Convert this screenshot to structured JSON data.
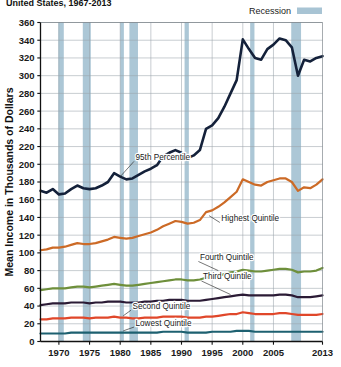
{
  "chart_data": {
    "type": "line",
    "title": "United States, 1967-2013",
    "title_visible_fragment": "United States, 1967-2013",
    "xlabel": "",
    "ylabel": "Mean Income in Thousands of Dollars",
    "xlim": [
      1967,
      2013
    ],
    "ylim": [
      0,
      360
    ],
    "ytick_step": 20,
    "yticks": [
      0,
      20,
      40,
      60,
      80,
      100,
      120,
      140,
      160,
      180,
      200,
      220,
      240,
      260,
      280,
      300,
      320,
      340,
      360
    ],
    "xticks": [
      1970,
      1975,
      1980,
      1985,
      1990,
      1995,
      2000,
      2005,
      2013
    ],
    "grid": "horizontal-and-vertical",
    "legend_position": "top-right",
    "legend": [
      {
        "label": "Recession",
        "color": "#a8c4d4",
        "type": "band"
      }
    ],
    "annotations": [
      {
        "text": "95th Percentile",
        "x": 1982.5,
        "y": 205,
        "leader_to_x": 1980.0,
        "leader_to_y": 186
      },
      {
        "text": "Highest  Quintile",
        "x": 1996.5,
        "y": 136,
        "leader_to_x": 1994.5,
        "leader_to_y": 142
      },
      {
        "text": "Fourth Quintile",
        "x": 1993.0,
        "y": 92,
        "leader_to_x": 1996.0,
        "leader_to_y": 80
      },
      {
        "text": "Third Quintile",
        "x": 1993.5,
        "y": 70,
        "leader_to_x": 1998.0,
        "leader_to_y": 53
      },
      {
        "text": "Second Quintile",
        "x": 1982.0,
        "y": 37,
        "leader_to_x": 1980.5,
        "leader_to_y": 29
      },
      {
        "text": "Lowest Quintile",
        "x": 1982.5,
        "y": 18,
        "leader_to_x": 1980.5,
        "leader_to_y": 12
      }
    ],
    "recessions": [
      {
        "start": 1969.9,
        "end": 1970.8
      },
      {
        "start": 1973.9,
        "end": 1975.2
      },
      {
        "start": 1980.0,
        "end": 1980.6
      },
      {
        "start": 1981.5,
        "end": 1982.9
      },
      {
        "start": 1990.5,
        "end": 1991.2
      },
      {
        "start": 2001.2,
        "end": 2001.9
      },
      {
        "start": 2007.9,
        "end": 2009.5
      }
    ],
    "x": [
      1967,
      1968,
      1969,
      1970,
      1971,
      1972,
      1973,
      1974,
      1975,
      1976,
      1977,
      1978,
      1979,
      1980,
      1981,
      1982,
      1983,
      1984,
      1985,
      1986,
      1987,
      1988,
      1989,
      1990,
      1991,
      1992,
      1993,
      1994,
      1995,
      1996,
      1997,
      1998,
      1999,
      2000,
      2001,
      2002,
      2003,
      2004,
      2005,
      2006,
      2007,
      2008,
      2009,
      2010,
      2011,
      2012,
      2013
    ],
    "series": [
      {
        "name": "95th Percentile",
        "color": "#14213a",
        "width": 2.6,
        "values": [
          170,
          168,
          172,
          166,
          167,
          172,
          176,
          173,
          172,
          173,
          176,
          180,
          190,
          186,
          183,
          184,
          188,
          192,
          195,
          199,
          209,
          213,
          216,
          213,
          207,
          210,
          216,
          240,
          244,
          252,
          265,
          280,
          295,
          341,
          330,
          320,
          318,
          330,
          335,
          342,
          340,
          332,
          300,
          318,
          316,
          320,
          322
        ]
      },
      {
        "name": "Highest Quintile",
        "color": "#cc6a26",
        "width": 2.2,
        "values": [
          103,
          104,
          106,
          106,
          107,
          109,
          111,
          110,
          110,
          111,
          113,
          115,
          118,
          117,
          116,
          117,
          119,
          121,
          123,
          126,
          130,
          133,
          136,
          135,
          133,
          134,
          137,
          146,
          148,
          152,
          157,
          163,
          169,
          183,
          180,
          177,
          176,
          180,
          182,
          184,
          184,
          180,
          170,
          174,
          173,
          177,
          183
        ]
      },
      {
        "name": "Fourth Quintile",
        "color": "#6e8f3b",
        "width": 2.2,
        "values": [
          58,
          59,
          60,
          60,
          60,
          61,
          62,
          62,
          61,
          62,
          63,
          64,
          65,
          64,
          63,
          63,
          64,
          65,
          66,
          67,
          68,
          69,
          70,
          70,
          69,
          69,
          70,
          72,
          73,
          74,
          76,
          78,
          79,
          81,
          80,
          79,
          79,
          80,
          81,
          82,
          82,
          81,
          78,
          79,
          79,
          80,
          83
        ]
      },
      {
        "name": "Third Quintile",
        "color": "#2b1b35",
        "width": 2.2,
        "values": [
          41,
          42,
          43,
          43,
          43,
          44,
          44,
          44,
          43,
          44,
          44,
          45,
          45,
          45,
          44,
          44,
          44,
          45,
          45,
          46,
          46,
          47,
          47,
          47,
          46,
          46,
          46,
          47,
          48,
          49,
          50,
          51,
          52,
          53,
          52,
          52,
          52,
          52,
          52,
          53,
          53,
          52,
          50,
          50,
          50,
          51,
          52
        ]
      },
      {
        "name": "Second Quintile",
        "color": "#e0472a",
        "width": 2.2,
        "values": [
          25,
          25,
          26,
          26,
          26,
          27,
          27,
          27,
          26,
          27,
          27,
          27,
          28,
          27,
          27,
          26,
          26,
          27,
          27,
          27,
          28,
          28,
          28,
          28,
          27,
          27,
          27,
          28,
          28,
          29,
          30,
          31,
          31,
          33,
          32,
          31,
          31,
          31,
          31,
          32,
          32,
          31,
          30,
          30,
          30,
          30,
          31
        ]
      },
      {
        "name": "Lowest Quintile",
        "color": "#1d6070",
        "width": 2.2,
        "values": [
          9,
          9,
          9,
          9,
          9,
          10,
          10,
          10,
          10,
          10,
          10,
          10,
          10,
          10,
          10,
          10,
          10,
          10,
          10,
          10,
          11,
          11,
          11,
          11,
          10,
          10,
          10,
          10,
          11,
          11,
          11,
          11,
          12,
          12,
          12,
          11,
          11,
          11,
          11,
          11,
          11,
          11,
          11,
          11,
          11,
          11,
          11
        ]
      }
    ]
  }
}
